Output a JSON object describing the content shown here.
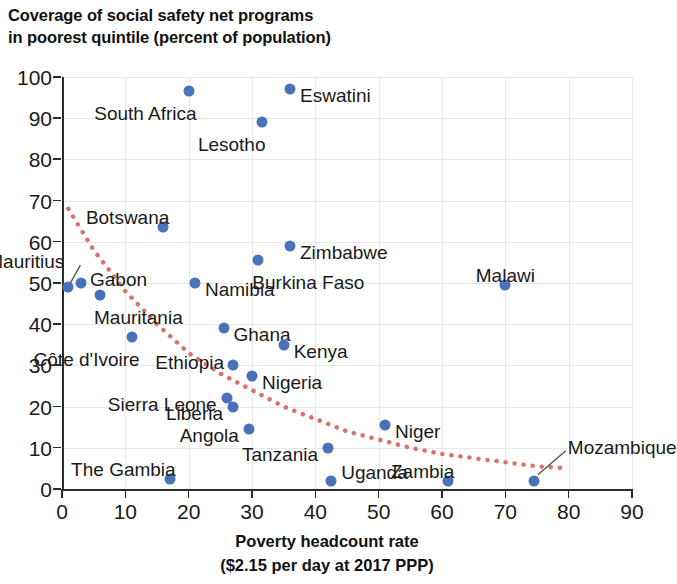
{
  "chart_data": {
    "type": "scatter",
    "title": "Coverage of social safety net programs in poorest quintile (percent of population)",
    "title_lines": [
      "Coverage of social safety net programs",
      "in poorest quintile (percent of population)"
    ],
    "xlabel": "Poverty headcount rate ($2.15 per day at 2017 PPP)",
    "xlabel_lines": [
      "Poverty headcount rate",
      "($2.15 per day at 2017 PPP)"
    ],
    "ylabel": "",
    "xlim": [
      0,
      90
    ],
    "ylim": [
      0,
      100
    ],
    "xticks": [
      0,
      10,
      20,
      30,
      40,
      50,
      60,
      70,
      80,
      90
    ],
    "yticks": [
      0,
      10,
      20,
      30,
      40,
      50,
      60,
      70,
      80,
      90,
      100
    ],
    "grid": true,
    "legend": false,
    "point_color": "#4a72b8",
    "trend_color": "#d9736a",
    "trendline": {
      "style": "dotted",
      "description": "downward-sloping dotted fitted curve",
      "points": [
        {
          "x": 1,
          "y": 68
        },
        {
          "x": 5,
          "y": 58
        },
        {
          "x": 10,
          "y": 48
        },
        {
          "x": 15,
          "y": 40
        },
        {
          "x": 20,
          "y": 33
        },
        {
          "x": 25,
          "y": 28
        },
        {
          "x": 30,
          "y": 24
        },
        {
          "x": 35,
          "y": 20
        },
        {
          "x": 40,
          "y": 17
        },
        {
          "x": 45,
          "y": 14
        },
        {
          "x": 50,
          "y": 12
        },
        {
          "x": 55,
          "y": 10
        },
        {
          "x": 60,
          "y": 8.5
        },
        {
          "x": 65,
          "y": 7.5
        },
        {
          "x": 70,
          "y": 6.5
        },
        {
          "x": 75,
          "y": 5.5
        },
        {
          "x": 80,
          "y": 5
        }
      ]
    },
    "points": [
      {
        "label": "Mauritius",
        "x": 1,
        "y": 49,
        "label_pos": "leader-up"
      },
      {
        "label": "Gabon",
        "x": 3,
        "y": 50,
        "label_pos": "right-up"
      },
      {
        "label": "Mauritania",
        "x": 6,
        "y": 47,
        "label_pos": "below-right"
      },
      {
        "label": "Côte d'Ivoire",
        "x": 11,
        "y": 37,
        "label_pos": "below-left"
      },
      {
        "label": "Botswana",
        "x": 16,
        "y": 63.5,
        "label_pos": "above-left"
      },
      {
        "label": "The Gambia",
        "x": 17,
        "y": 2.5,
        "label_pos": "above-left"
      },
      {
        "label": "South Africa",
        "x": 20,
        "y": 96.5,
        "label_pos": "below-left"
      },
      {
        "label": "Namibia",
        "x": 21,
        "y": 50,
        "label_pos": "right"
      },
      {
        "label": "Ghana",
        "x": 25.5,
        "y": 39,
        "label_pos": "right"
      },
      {
        "label": "Sierra Leone",
        "x": 26,
        "y": 22,
        "label_pos": "left"
      },
      {
        "label": "Liberia",
        "x": 27,
        "y": 20,
        "label_pos": "left"
      },
      {
        "label": "Ethiopia",
        "x": 27,
        "y": 30,
        "label_pos": "left-up"
      },
      {
        "label": "Angola",
        "x": 29.5,
        "y": 14.5,
        "label_pos": "left"
      },
      {
        "label": "Nigeria",
        "x": 30,
        "y": 27.5,
        "label_pos": "right"
      },
      {
        "label": "Burkina Faso",
        "x": 31,
        "y": 55.5,
        "label_pos": "below-right"
      },
      {
        "label": "Lesotho",
        "x": 31.5,
        "y": 89,
        "label_pos": "below"
      },
      {
        "label": "Kenya",
        "x": 35,
        "y": 35,
        "label_pos": "right"
      },
      {
        "label": "Eswatini",
        "x": 36,
        "y": 97,
        "label_pos": "right"
      },
      {
        "label": "Zimbabwe",
        "x": 36,
        "y": 59,
        "label_pos": "right"
      },
      {
        "label": "Tanzania",
        "x": 42,
        "y": 10,
        "label_pos": "left"
      },
      {
        "label": "Uganda",
        "x": 42.5,
        "y": 2,
        "label_pos": "right-below"
      },
      {
        "label": "Niger",
        "x": 51,
        "y": 15.5,
        "label_pos": "right"
      },
      {
        "label": "Zambia",
        "x": 61,
        "y": 2,
        "label_pos": "above-left"
      },
      {
        "label": "Malawi",
        "x": 70,
        "y": 49.5,
        "label_pos": "above"
      },
      {
        "label": "Mozambique",
        "x": 74.5,
        "y": 2,
        "label_pos": "leader-up-right"
      }
    ]
  }
}
